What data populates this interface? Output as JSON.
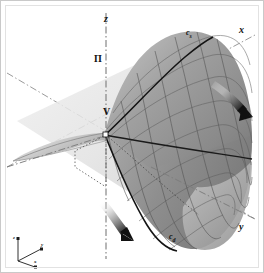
{
  "figure": {
    "type": "3d-surface-diagram",
    "background_color": "#ffffff",
    "frame_border_color": "#c9c9c9",
    "surface_color_light": "#b8b8b8",
    "surface_color_mid": "#9a9a9a",
    "surface_color_dark": "#6f6f6f",
    "mesh_line_color": "#4a4a4a",
    "axis_line_color": "#8f8f8f",
    "plane_color": "#dedede",
    "label_color": "#111111"
  },
  "axes": {
    "z_label": "z",
    "x_label": "x",
    "y_label": "y",
    "style": "dash-dot"
  },
  "plane": {
    "label": "Π"
  },
  "vertex": {
    "label": "V"
  },
  "curves": [
    {
      "name": "curve-cs",
      "base": "c",
      "subscript": "s"
    },
    {
      "name": "curve-cd",
      "base": "c",
      "subscript": "d"
    }
  ],
  "arrows": [
    {
      "name": "arrow-right",
      "direction": "down-right"
    },
    {
      "name": "arrow-bottom",
      "direction": "down-left"
    }
  ],
  "orientation_triad": {
    "z_label": "z",
    "y_label": "y",
    "x_label": "x"
  }
}
